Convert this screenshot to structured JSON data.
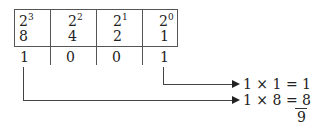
{
  "table": {
    "columns": [
      {
        "base": "2",
        "exponent": "3",
        "value": "8",
        "bit": "1"
      },
      {
        "base": "2",
        "exponent": "2",
        "value": "4",
        "bit": "0"
      },
      {
        "base": "2",
        "exponent": "1",
        "value": "2",
        "bit": "0"
      },
      {
        "base": "2",
        "exponent": "0",
        "value": "1",
        "bit": "1"
      }
    ]
  },
  "equations": [
    {
      "text": "1 × 1 = 1"
    },
    {
      "text": "1 × 8 = ",
      "result": "8"
    }
  ],
  "sum": "9"
}
